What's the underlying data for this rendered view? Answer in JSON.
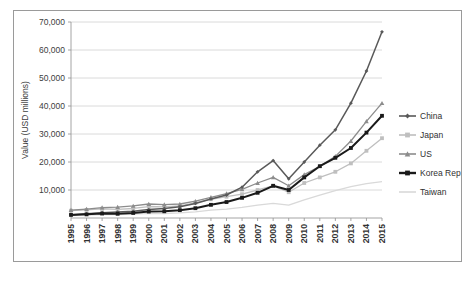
{
  "chart_data": {
    "type": "line",
    "title": "",
    "xlabel": "",
    "ylabel": "Value (USD millions)",
    "ylim": [
      0,
      70000
    ],
    "ytick_labels": [
      "70,000",
      "60,000",
      "50,000",
      "40,000",
      "30,000",
      "20,000",
      "10,000"
    ],
    "ytick_values": [
      70000,
      60000,
      50000,
      40000,
      30000,
      20000,
      10000
    ],
    "grid": true,
    "legend_position": "right",
    "categories": [
      "1995",
      "1996",
      "1997",
      "1998",
      "1999",
      "2000",
      "2001",
      "2002",
      "2003",
      "2004",
      "2005",
      "2006",
      "2007",
      "2008",
      "2009",
      "2010",
      "2011",
      "2012",
      "2013",
      "2014",
      "2015"
    ],
    "x": [
      1995,
      1996,
      1997,
      1998,
      1999,
      2000,
      2001,
      2002,
      2003,
      2004,
      2005,
      2006,
      2007,
      2008,
      2009,
      2010,
      2011,
      2012,
      2013,
      2014,
      2015
    ],
    "series": [
      {
        "name": "China",
        "color": "#595959",
        "marker": "diamond",
        "values": [
          1200,
          1500,
          1900,
          2100,
          2400,
          3000,
          3400,
          4000,
          5200,
          6800,
          8200,
          11000,
          16500,
          20500,
          14000,
          20000,
          26000,
          31500,
          41000,
          52500,
          66500
        ]
      },
      {
        "name": "Japan",
        "color": "#bfbfbf",
        "marker": "square",
        "values": [
          2600,
          2900,
          3300,
          3100,
          3400,
          4100,
          4000,
          4300,
          5400,
          6700,
          7600,
          8500,
          10000,
          11500,
          9200,
          12500,
          14500,
          16500,
          19500,
          24000,
          28500
        ]
      },
      {
        "name": "US",
        "color": "#8c8c8c",
        "marker": "triangle",
        "values": [
          2800,
          3200,
          3700,
          3900,
          4300,
          5000,
          4800,
          5000,
          6000,
          7400,
          8700,
          10200,
          12500,
          14500,
          11500,
          15500,
          18500,
          22000,
          27500,
          34500,
          41000
        ]
      },
      {
        "name": "Korea Rep. of",
        "color": "#1a1a1a",
        "marker": "square",
        "values": [
          1100,
          1300,
          1600,
          1500,
          1800,
          2300,
          2400,
          2800,
          3500,
          4700,
          5700,
          7200,
          9000,
          11500,
          10000,
          14500,
          18500,
          21500,
          25000,
          30500,
          36500
        ]
      },
      {
        "name": "Taiwan",
        "color": "#d9d9d9",
        "marker": "none",
        "values": [
          900,
          1000,
          1200,
          1200,
          1400,
          1700,
          1600,
          1800,
          2200,
          2800,
          3200,
          3800,
          4600,
          5200,
          4600,
          6500,
          8200,
          9800,
          11200,
          12300,
          13000
        ]
      }
    ]
  }
}
